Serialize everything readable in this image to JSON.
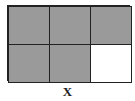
{
  "diagram": {
    "rows": 2,
    "columns": 3,
    "cells": [
      {
        "row": 1,
        "col": 1,
        "shaded": true
      },
      {
        "row": 1,
        "col": 2,
        "shaded": true
      },
      {
        "row": 1,
        "col": 3,
        "shaded": true
      },
      {
        "row": 2,
        "col": 1,
        "shaded": true
      },
      {
        "row": 2,
        "col": 2,
        "shaded": true
      },
      {
        "row": 2,
        "col": 3,
        "shaded": false
      }
    ],
    "shaded_count": 5,
    "total_count": 6,
    "shade_color": "#9a9a9a",
    "label": "X"
  }
}
